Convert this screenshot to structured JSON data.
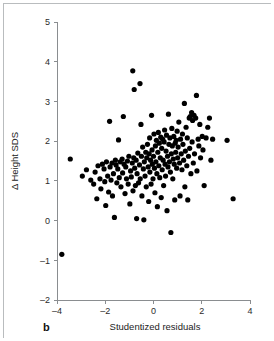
{
  "figure": {
    "panel_label": "b",
    "background_color": "#ffffff",
    "frame_color": "#b9bcbe"
  },
  "chart_data": {
    "type": "scatter",
    "title": "",
    "xlabel": "Studentized residuals",
    "ylabel": "Δ Height SDS",
    "xlim": [
      -4,
      4
    ],
    "ylim": [
      -2,
      5
    ],
    "xticks": [
      -4,
      -2,
      0,
      2,
      4
    ],
    "xtick_labels": [
      "–4",
      "–2",
      "0",
      "2",
      "4"
    ],
    "yticks": [
      -2,
      -1,
      0,
      1,
      2,
      3,
      4,
      5
    ],
    "ytick_labels": [
      "–2",
      "–1",
      "0",
      "1",
      "2",
      "3",
      "4",
      "5"
    ],
    "grid": false,
    "legend": null,
    "marker": {
      "shape": "circle",
      "color": "#000000",
      "size": 2.6
    },
    "n_points": 183,
    "points": [
      [
        -3.8,
        -0.85
      ],
      [
        -3.45,
        1.55
      ],
      [
        -2.95,
        1.12
      ],
      [
        -2.78,
        1.28
      ],
      [
        -2.6,
        1.02
      ],
      [
        -2.48,
        0.92
      ],
      [
        -2.42,
        1.22
      ],
      [
        -2.35,
        0.55
      ],
      [
        -2.3,
        1.38
      ],
      [
        -2.22,
        1.05
      ],
      [
        -2.18,
        0.8
      ],
      [
        -2.12,
        1.42
      ],
      [
        -2.05,
        1.3
      ],
      [
        -2.02,
        0.98
      ],
      [
        -1.98,
        0.38
      ],
      [
        -1.95,
        1.48
      ],
      [
        -1.9,
        1.12
      ],
      [
        -1.86,
        0.72
      ],
      [
        -1.82,
        2.5
      ],
      [
        -1.8,
        1.35
      ],
      [
        -1.76,
        1.02
      ],
      [
        -1.72,
        1.45
      ],
      [
        -1.7,
        0.62
      ],
      [
        -1.66,
        1.18
      ],
      [
        -1.62,
        0.08
      ],
      [
        -1.58,
        1.52
      ],
      [
        -1.55,
        1.4
      ],
      [
        -1.52,
        0.95
      ],
      [
        -1.48,
        1.3
      ],
      [
        -1.45,
        2.03
      ],
      [
        -1.42,
        1.08
      ],
      [
        -1.38,
        1.48
      ],
      [
        -1.35,
        0.85
      ],
      [
        -1.3,
        1.55
      ],
      [
        -1.28,
        1.2
      ],
      [
        -1.25,
        2.62
      ],
      [
        -1.22,
        1.42
      ],
      [
        -1.18,
        0.68
      ],
      [
        -1.15,
        1.35
      ],
      [
        -1.12,
        1.05
      ],
      [
        -1.08,
        1.5
      ],
      [
        -1.05,
        0.92
      ],
      [
        -1.02,
        1.62
      ],
      [
        -0.98,
        0.42
      ],
      [
        -0.95,
        1.25
      ],
      [
        -0.92,
        1.1
      ],
      [
        -0.88,
        1.45
      ],
      [
        -0.86,
        3.77
      ],
      [
        -0.85,
        0.75
      ],
      [
        -0.82,
        1.58
      ],
      [
        -0.8,
        3.3
      ],
      [
        -0.78,
        1.32
      ],
      [
        -0.75,
        0.88
      ],
      [
        -0.72,
        1.52
      ],
      [
        -0.7,
        0.05
      ],
      [
        -0.68,
        1.18
      ],
      [
        -0.65,
        1.7
      ],
      [
        -0.62,
        0.95
      ],
      [
        -0.58,
        1.4
      ],
      [
        -0.56,
        3.45
      ],
      [
        -0.55,
        1.05
      ],
      [
        -0.52,
        2.42
      ],
      [
        -0.5,
        1.62
      ],
      [
        -0.48,
        0.62
      ],
      [
        -0.45,
        1.85
      ],
      [
        -0.42,
        1.3
      ],
      [
        -0.4,
        0.02
      ],
      [
        -0.38,
        1.48
      ],
      [
        -0.35,
        1.12
      ],
      [
        -0.32,
        1.72
      ],
      [
        -0.3,
        0.85
      ],
      [
        -0.28,
        1.58
      ],
      [
        -0.25,
        1.92
      ],
      [
        -0.22,
        1.35
      ],
      [
        -0.2,
        0.48
      ],
      [
        -0.18,
        1.68
      ],
      [
        -0.16,
        2.08
      ],
      [
        -0.15,
        1.22
      ],
      [
        -0.12,
        1.52
      ],
      [
        -0.1,
        0.92
      ],
      [
        -0.08,
        2.65
      ],
      [
        -0.06,
        1.78
      ],
      [
        -0.05,
        1.42
      ],
      [
        -0.02,
        1.05
      ],
      [
        0.0,
        1.62
      ],
      [
        0.02,
        2.18
      ],
      [
        0.04,
        1.32
      ],
      [
        0.06,
        0.7
      ],
      [
        0.08,
        1.88
      ],
      [
        0.1,
        1.48
      ],
      [
        0.12,
        2.02
      ],
      [
        0.14,
        1.18
      ],
      [
        0.16,
        0.35
      ],
      [
        0.18,
        1.72
      ],
      [
        0.2,
        2.22
      ],
      [
        0.22,
        1.38
      ],
      [
        0.24,
        1.95
      ],
      [
        0.26,
        1.08
      ],
      [
        0.28,
        1.58
      ],
      [
        0.3,
        2.1
      ],
      [
        0.32,
        0.58
      ],
      [
        0.34,
        1.82
      ],
      [
        0.36,
        1.28
      ],
      [
        0.38,
        2.05
      ],
      [
        0.4,
        1.52
      ],
      [
        0.42,
        0.88
      ],
      [
        0.44,
        1.98
      ],
      [
        0.46,
        2.28
      ],
      [
        0.48,
        1.42
      ],
      [
        0.5,
        1.12
      ],
      [
        0.52,
        1.75
      ],
      [
        0.54,
        2.15
      ],
      [
        0.56,
        0.25
      ],
      [
        0.58,
        1.62
      ],
      [
        0.6,
        1.35
      ],
      [
        0.62,
        2.68
      ],
      [
        0.64,
        1.92
      ],
      [
        0.66,
        1.48
      ],
      [
        0.68,
        2.08
      ],
      [
        0.7,
        1.22
      ],
      [
        0.72,
        -0.3
      ],
      [
        0.74,
        1.68
      ],
      [
        0.76,
        2.32
      ],
      [
        0.78,
        1.88
      ],
      [
        0.8,
        1.05
      ],
      [
        0.82,
        1.55
      ],
      [
        0.84,
        2.12
      ],
      [
        0.86,
        1.42
      ],
      [
        0.88,
        0.52
      ],
      [
        0.9,
        1.95
      ],
      [
        0.92,
        1.72
      ],
      [
        0.94,
        2.02
      ],
      [
        0.96,
        1.32
      ],
      [
        0.98,
        2.25
      ],
      [
        1.0,
        1.58
      ],
      [
        1.02,
        1.85
      ],
      [
        1.05,
        2.48
      ],
      [
        1.08,
        1.45
      ],
      [
        1.1,
        0.62
      ],
      [
        1.12,
        2.05
      ],
      [
        1.15,
        1.68
      ],
      [
        1.18,
        1.28
      ],
      [
        1.2,
        2.18
      ],
      [
        1.22,
        1.92
      ],
      [
        1.25,
        1.52
      ],
      [
        1.28,
        2.95
      ],
      [
        1.3,
        0.85
      ],
      [
        1.32,
        1.75
      ],
      [
        1.35,
        2.35
      ],
      [
        1.38,
        1.38
      ],
      [
        1.4,
        2.08
      ],
      [
        1.42,
        0.52
      ],
      [
        1.45,
        1.62
      ],
      [
        1.48,
        2.58
      ],
      [
        1.5,
        1.82
      ],
      [
        1.52,
        2.62
      ],
      [
        1.55,
        1.18
      ],
      [
        1.58,
        2.72
      ],
      [
        1.6,
        1.98
      ],
      [
        1.62,
        2.52
      ],
      [
        1.65,
        1.45
      ],
      [
        1.68,
        2.65
      ],
      [
        1.7,
        1.68
      ],
      [
        1.75,
        2.58
      ],
      [
        1.78,
        3.15
      ],
      [
        1.8,
        1.25
      ],
      [
        1.85,
        2.05
      ],
      [
        1.88,
        1.88
      ],
      [
        1.92,
        2.42
      ],
      [
        1.95,
        1.58
      ],
      [
        2.02,
        2.12
      ],
      [
        2.05,
        1.78
      ],
      [
        2.1,
        0.88
      ],
      [
        2.18,
        2.08
      ],
      [
        2.25,
        2.35
      ],
      [
        2.32,
        2.58
      ],
      [
        2.38,
        1.52
      ],
      [
        2.45,
        2.05
      ],
      [
        3.05,
        2.02
      ],
      [
        3.3,
        0.55
      ]
    ]
  }
}
